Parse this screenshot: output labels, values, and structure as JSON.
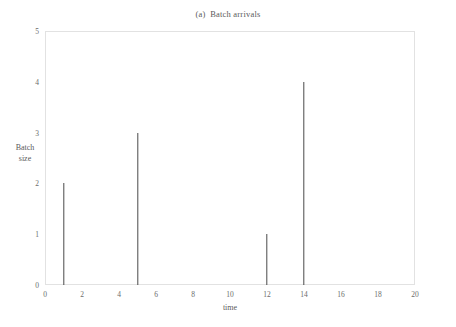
{
  "chart_data": {
    "type": "bar",
    "title": "(a)  Batch arrivals",
    "xlabel": "time",
    "ylabel_lines": [
      "Batch",
      "size"
    ],
    "ylabel": "Batch size",
    "x": [
      1,
      5,
      12,
      14
    ],
    "values": [
      2,
      3,
      1,
      4
    ],
    "points": [
      {
        "x": 1,
        "y": 2
      },
      {
        "x": 5,
        "y": 3
      },
      {
        "x": 12,
        "y": 1
      },
      {
        "x": 14,
        "y": 4
      }
    ],
    "xlim": [
      0,
      20
    ],
    "ylim": [
      0,
      5
    ],
    "xticks": [
      0,
      2,
      4,
      6,
      8,
      10,
      12,
      14,
      16,
      18,
      20
    ],
    "xtick_labels": [
      "0",
      "2",
      "4",
      "6",
      "8",
      "10",
      "12",
      "14",
      "16",
      "18",
      "20"
    ],
    "yticks": [
      0,
      1,
      2,
      3,
      4,
      5
    ],
    "ytick_labels": [
      "0",
      "1",
      "2",
      "3",
      "4",
      "5"
    ],
    "grid": false,
    "legend": null,
    "series_color": "#4a4a4a",
    "frame_color": "#e2e2e2",
    "background": "#ffffff"
  }
}
